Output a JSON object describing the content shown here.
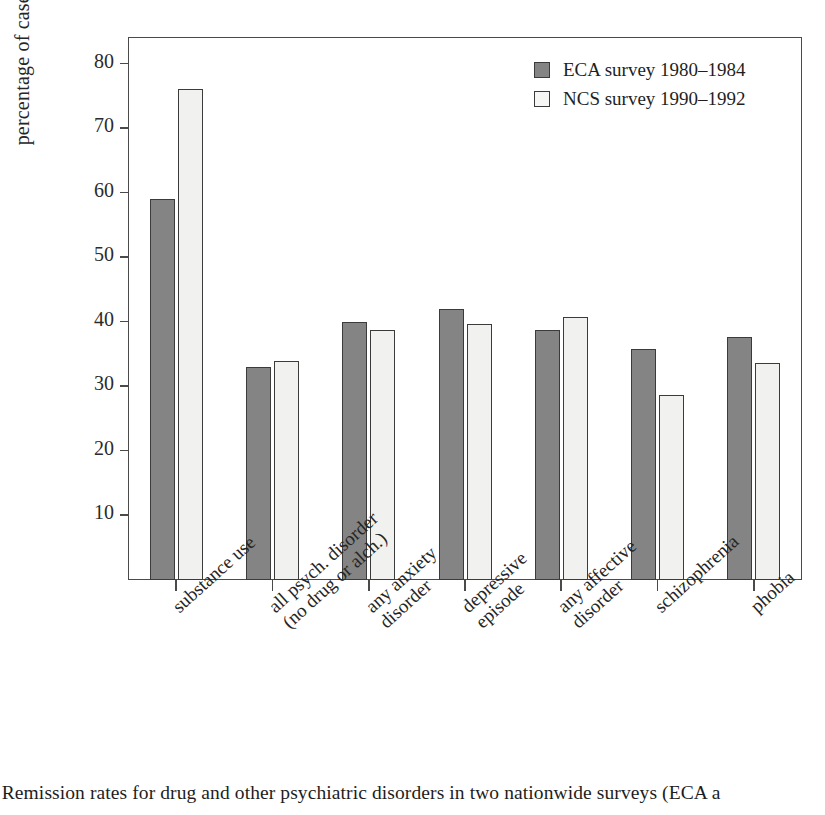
{
  "figure": {
    "caption": "e Remission rates for drug and other psychiatric disorders in two nationwide surveys (ECA a"
  },
  "legend": {
    "position": "top-right",
    "entries": [
      {
        "label": "ECA  survey 1980–1984",
        "color": "#848484",
        "key": "eca"
      },
      {
        "label": "NCS survey 1990–1992",
        "color": "#f1f1ef",
        "key": "ncs"
      }
    ]
  },
  "axes": {
    "ylabel": "percentage of cases remitted",
    "xlabel": "",
    "yticks": [
      10,
      20,
      30,
      40,
      50,
      60,
      70,
      80
    ],
    "ytick_labels": [
      "10",
      "20",
      "30",
      "40",
      "50",
      "60",
      "70",
      "80"
    ],
    "ylim": [
      0,
      84
    ],
    "grid": false
  },
  "chart_data": {
    "type": "bar",
    "title": "",
    "xlabel": "",
    "ylabel": "percentage of cases remitted",
    "ylim": [
      0,
      84
    ],
    "grid": false,
    "legend_position": "top-right",
    "categories": [
      "substance use",
      "all psych. disorder (no drug or alch.)",
      "any anxiety disorder",
      "depressive episode",
      "any affective disorder",
      "schizophrenia",
      "phobia"
    ],
    "category_lines": [
      [
        "substance use",
        ""
      ],
      [
        "all psych. disorder",
        "(no drug or alch.)"
      ],
      [
        "any anxiety",
        "disorder"
      ],
      [
        "depressive",
        "episode"
      ],
      [
        "any affective",
        "disorder"
      ],
      [
        "schizophrenia",
        ""
      ],
      [
        "phobia",
        ""
      ]
    ],
    "series": [
      {
        "name": "ECA  survey 1980–1984",
        "color": "#848484",
        "values": [
          59,
          33,
          40,
          42,
          38.8,
          35.8,
          37.6
        ]
      },
      {
        "name": "NCS survey 1990–1992",
        "color": "#f1f1ef",
        "values": [
          76,
          34,
          38.8,
          39.7,
          40.8,
          28.7,
          33.6
        ]
      }
    ]
  }
}
